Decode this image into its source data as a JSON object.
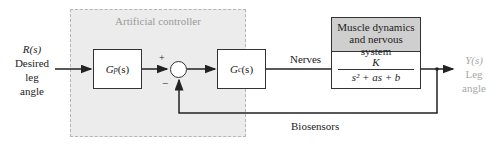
{
  "diagram": {
    "controller_region": {
      "title": "Artificial controller"
    },
    "input": {
      "signal": "R(s)",
      "description_lines": [
        "Desired",
        "leg",
        "angle"
      ]
    },
    "blocks": {
      "prefilter": {
        "label": "Gp(s)",
        "base": "G",
        "sub": "p",
        "arg": "(s)"
      },
      "controller": {
        "label": "Gc(s)",
        "base": "G",
        "sub": "c",
        "arg": "(s)"
      },
      "plant": {
        "title_lines": [
          "Muscle dynamics",
          "and nervous system"
        ],
        "numerator": "K",
        "denominator": "s² + as + b"
      }
    },
    "summing_junction": {
      "plus_sign": "+",
      "minus_sign": "−"
    },
    "signal_labels": {
      "nerves": "Nerves",
      "biosensors": "Biosensors"
    },
    "output": {
      "signal": "Y(s)",
      "description_lines": [
        "Leg",
        "angle"
      ]
    },
    "colors": {
      "controller_bg": "#ececec",
      "plant_header_bg": "#cfcfcf",
      "output_text": "#a8a8a8",
      "lines": "#222222"
    }
  }
}
